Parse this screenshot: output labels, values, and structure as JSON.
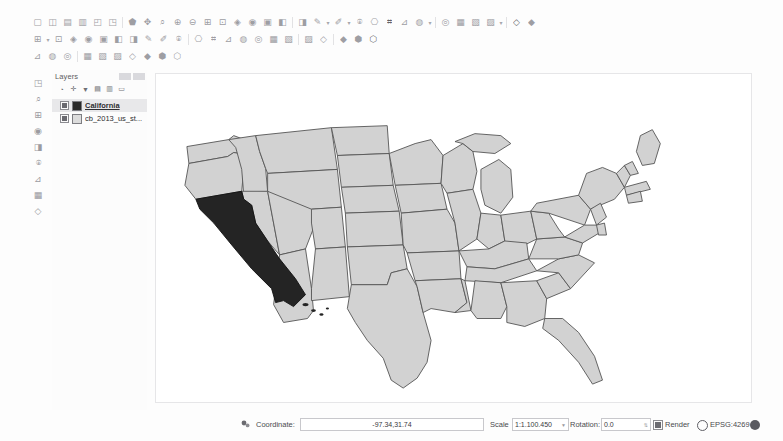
{
  "app": {
    "name": "QGIS Desktop"
  },
  "toolbars": {
    "row1": [
      {
        "icon": "new-project-icon"
      },
      {
        "icon": "open-project-icon"
      },
      {
        "icon": "save-project-icon"
      },
      {
        "icon": "save-project-as-icon"
      },
      {
        "icon": "new-print-layout-icon"
      },
      {
        "icon": "style-manager-icon"
      },
      {
        "sep": true
      },
      {
        "icon": "pan-map-icon"
      },
      {
        "icon": "pan-to-selection-icon"
      },
      {
        "icon": "zoom-in-icon"
      },
      {
        "icon": "zoom-out-icon"
      },
      {
        "icon": "zoom-full-icon"
      },
      {
        "icon": "zoom-selection-icon"
      },
      {
        "icon": "zoom-layer-icon"
      },
      {
        "icon": "zoom-native-icon"
      },
      {
        "icon": "zoom-last-icon"
      },
      {
        "icon": "zoom-next-icon"
      },
      {
        "icon": "refresh-icon"
      },
      {
        "sep": true
      },
      {
        "icon": "identify-features-icon"
      },
      {
        "icon": "measure-line-icon"
      },
      {
        "caret": true
      },
      {
        "icon": "select-features-icon"
      },
      {
        "caret": true
      },
      {
        "icon": "deselect-features-icon"
      },
      {
        "icon": "select-by-expression-icon"
      },
      {
        "icon": "open-attribute-table-icon"
      },
      {
        "icon": "field-calculator-icon"
      },
      {
        "icon": "statistical-summary-icon"
      },
      {
        "caret": true
      },
      {
        "sep": true
      },
      {
        "icon": "show-map-tips-icon"
      },
      {
        "icon": "new-bookmark-icon"
      },
      {
        "icon": "show-bookmarks-icon"
      },
      {
        "icon": "text-annotation-icon"
      },
      {
        "caret": true
      },
      {
        "sep": true
      },
      {
        "icon": "python-console-icon"
      },
      {
        "icon": "help-icon"
      }
    ],
    "row2": [
      {
        "icon": "current-edits-icon"
      },
      {
        "caret": true
      },
      {
        "icon": "toggle-editing-icon"
      },
      {
        "icon": "save-layer-edits-icon"
      },
      {
        "icon": "add-feature-icon"
      },
      {
        "icon": "add-polygon-feature-icon"
      },
      {
        "icon": "vertex-tool-icon"
      },
      {
        "icon": "delete-selected-icon"
      },
      {
        "icon": "cut-features-icon"
      },
      {
        "icon": "copy-features-icon"
      },
      {
        "icon": "paste-features-icon"
      },
      {
        "sep": true
      },
      {
        "icon": "undo-icon"
      },
      {
        "icon": "redo-icon"
      },
      {
        "icon": "move-feature-icon"
      },
      {
        "icon": "rotate-feature-icon"
      },
      {
        "icon": "simplify-feature-icon"
      },
      {
        "icon": "add-ring-icon"
      },
      {
        "icon": "add-part-icon"
      },
      {
        "sep": true
      },
      {
        "icon": "fill-ring-icon"
      },
      {
        "icon": "delete-ring-icon"
      },
      {
        "sep": true
      },
      {
        "icon": "reshape-features-icon"
      },
      {
        "icon": "split-features-icon"
      },
      {
        "icon": "merge-features-icon"
      }
    ],
    "row3": [
      {
        "icon": "add-vector-layer-icon"
      },
      {
        "icon": "add-raster-layer-icon"
      },
      {
        "icon": "add-mesh-layer-icon"
      },
      {
        "sep": true
      },
      {
        "icon": "add-delimited-text-layer-icon"
      },
      {
        "icon": "add-postgis-layer-icon"
      },
      {
        "icon": "add-spatialite-layer-icon"
      },
      {
        "icon": "add-mssql-layer-icon"
      },
      {
        "icon": "add-oracle-layer-icon"
      },
      {
        "icon": "add-wms-layer-icon"
      },
      {
        "icon": "add-wcs-layer-icon"
      }
    ]
  },
  "left_toolbar": {
    "items": [
      {
        "icon": "digitizing-toolbar-icon"
      },
      {
        "icon": "advanced-digitizing-icon"
      },
      {
        "icon": "snapping-options-icon"
      },
      {
        "icon": "measure-tool-icon"
      },
      {
        "icon": "map-navigation-icon"
      },
      {
        "icon": "label-toolbar-icon"
      },
      {
        "icon": "processing-toolbox-icon"
      },
      {
        "icon": "plugins-toolbar-icon"
      },
      {
        "icon": "vector-tools-icon"
      }
    ]
  },
  "layers_panel": {
    "title": "Layers",
    "minimize_label": "",
    "close_label": "",
    "toolbar": [
      {
        "icon": "open-layer-styling-panel-icon"
      },
      {
        "icon": "add-group-icon"
      },
      {
        "icon": "filter-legend-icon"
      },
      {
        "icon": "expand-all-icon"
      },
      {
        "icon": "collapse-all-icon"
      },
      {
        "icon": "remove-layer-icon"
      }
    ],
    "layers": [
      {
        "name": "California",
        "checked": true,
        "selected": true,
        "swatch": "dark"
      },
      {
        "name": "cb_2013_us_st...",
        "checked": true,
        "selected": false,
        "swatch": "light"
      }
    ]
  },
  "status_bar": {
    "message_icon": "message-log-icon",
    "coordinate_label": "Coordinate:",
    "coordinate_value": "-97.34,31.74",
    "scale_label": "Scale",
    "scale_value": "1:1.100.450",
    "rotation_label": "Rotation:",
    "rotation_value": "0.0",
    "render_label": "Render",
    "render_checked": true,
    "crs_label": "EPSG:4269",
    "messages_icon": "globe-icon"
  },
  "map": {
    "title": "United States map",
    "selected_state": "California",
    "colors": {
      "state_fill": "#d2d2d2",
      "state_border": "#555555",
      "selected_fill": "#242424",
      "canvas_background": "#ffffff"
    }
  }
}
